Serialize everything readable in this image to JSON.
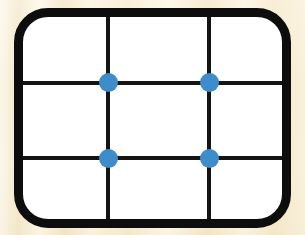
{
  "diagram": {
    "background": {
      "name": "wood-texture-background",
      "color": "#f6ecd2"
    },
    "frame": {
      "name": "rounded-rectangle-frame",
      "shape": "rounded-rectangle",
      "border_color": "#0d0d0d",
      "border_width_px": 9,
      "corner_radius_px": 34,
      "fill_color": "#ffffff",
      "x": 14,
      "y": 8,
      "width": 277,
      "height": 220
    },
    "grid": {
      "name": "interior-grid",
      "columns": 3,
      "rows": 3,
      "line_color": "#141414",
      "line_width_px": 4,
      "vertical_lines": [
        {
          "id": "v1",
          "x_pct": 33.0
        },
        {
          "id": "v2",
          "x_pct": 72.0
        }
      ],
      "horizontal_lines": [
        {
          "id": "h1",
          "y_pct": 32.5
        },
        {
          "id": "h2",
          "y_pct": 70.0
        }
      ]
    },
    "nodes": {
      "name": "intersection-nodes",
      "color": "#3f8ccb",
      "diameter_px": 19,
      "count": 4,
      "items": [
        {
          "id": "node-top-left",
          "label": "v1 × h1",
          "x_pct": 33.0,
          "y_pct": 32.5
        },
        {
          "id": "node-top-right",
          "label": "v2 × h1",
          "x_pct": 72.0,
          "y_pct": 32.5
        },
        {
          "id": "node-bottom-left",
          "label": "v1 × h2",
          "x_pct": 33.0,
          "y_pct": 70.0
        },
        {
          "id": "node-bottom-right",
          "label": "v2 × h2",
          "x_pct": 72.0,
          "y_pct": 70.0
        }
      ]
    }
  }
}
